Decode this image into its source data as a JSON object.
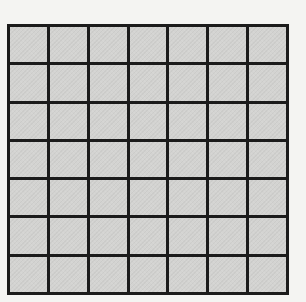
{
  "grid": {
    "rows": 7,
    "columns": 7,
    "cell_color": "#d3d3d1",
    "line_color": "#1b1b1b",
    "background_color": "#f4f4f2"
  }
}
